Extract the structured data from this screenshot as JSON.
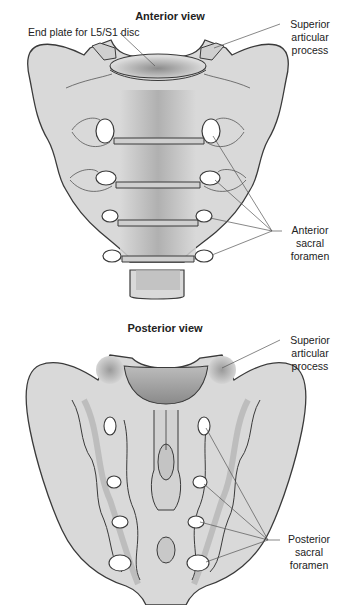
{
  "anterior": {
    "title": "Anterior view",
    "labels": {
      "end_plate": "End plate for L5/S1 disc",
      "superior_articular_line1": "Superior",
      "superior_articular_line2": "articular",
      "superior_articular_line3": "process",
      "foramen_line1": "Anterior",
      "foramen_line2": "sacral",
      "foramen_line3": "foramen"
    }
  },
  "posterior": {
    "title": "Posterior view",
    "labels": {
      "superior_articular_line1": "Superior",
      "superior_articular_line2": "articular",
      "superior_articular_line3": "process",
      "foramen_line1": "Posterior",
      "foramen_line2": "sacral",
      "foramen_line3": "foramen"
    }
  },
  "colors": {
    "bone_fill": "#d9d9d9",
    "bone_outline": "#3a3a3a",
    "shadow": "#a8a8a8",
    "foramen": "#ffffff",
    "leader_line": "#555555"
  }
}
